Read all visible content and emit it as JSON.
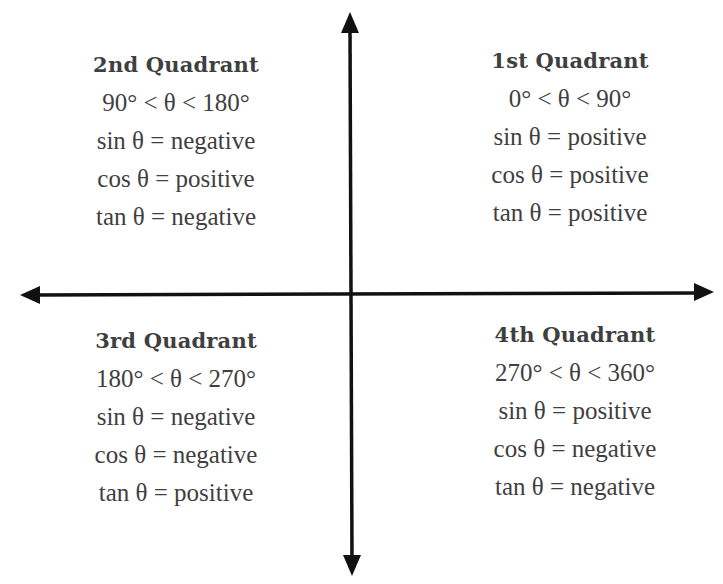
{
  "diagram": {
    "type": "cartesian-quadrants",
    "axis_color": "#111111",
    "text_color": "#3f3f3f",
    "origin": {
      "x": 352,
      "y": 294
    }
  },
  "quadrants": {
    "q1": {
      "title": "1st Quadrant",
      "range": "0° < θ < 90°",
      "sin": "sin θ = positive",
      "cos": "cos θ = positive",
      "tan": "tan θ = positive"
    },
    "q2": {
      "title": "2nd Quadrant",
      "range": "90° < θ < 180°",
      "sin": "sin θ = negative",
      "cos": "cos θ = positive",
      "tan": "tan θ = negative"
    },
    "q3": {
      "title": "3rd Quadrant",
      "range": "180° < θ < 270°",
      "sin": "sin θ = negative",
      "cos": "cos θ = negative",
      "tan": "tan θ = positive"
    },
    "q4": {
      "title": "4th Quadrant",
      "range": "270° < θ < 360°",
      "sin": "sin θ = positive",
      "cos": "cos θ = negative",
      "tan": "tan θ = negative"
    }
  }
}
